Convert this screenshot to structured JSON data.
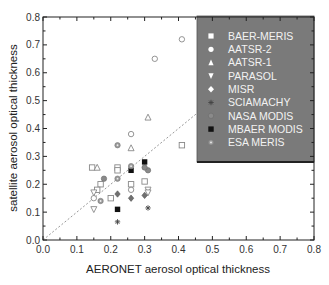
{
  "chart_data": {
    "type": "scatter",
    "title": "",
    "xlabel": "AERONET aerosol optical thickness",
    "ylabel": "satellite aerosol optical thickness",
    "xlim": [
      0.0,
      0.8
    ],
    "ylim": [
      0.0,
      0.8
    ],
    "xticks": [
      "0.0",
      "0.1",
      "0.2",
      "0.3",
      "0.4",
      "0.5",
      "0.6",
      "0.7",
      "0.8"
    ],
    "yticks": [
      "0.0",
      "0.1",
      "0.2",
      "0.3",
      "0.4",
      "0.5",
      "0.6",
      "0.7",
      "0.8"
    ],
    "grid": false,
    "legend_position": "top-right",
    "reference_line": {
      "style": "dotted",
      "label": "1:1",
      "from": [
        0.0,
        0.0
      ],
      "to": [
        0.8,
        0.8
      ]
    },
    "series": [
      {
        "name": "BAER-MERIS",
        "marker": "square-open",
        "points": [
          [
            0.145,
            0.26
          ],
          [
            0.17,
            0.2
          ],
          [
            0.16,
            0.18
          ],
          [
            0.2,
            0.15
          ],
          [
            0.22,
            0.26
          ],
          [
            0.22,
            0.25
          ],
          [
            0.26,
            0.2
          ],
          [
            0.3,
            0.21
          ],
          [
            0.41,
            0.34
          ]
        ]
      },
      {
        "name": "AATSR-2",
        "marker": "circle-open",
        "points": [
          [
            0.41,
            0.72
          ],
          [
            0.33,
            0.65
          ],
          [
            0.26,
            0.38
          ],
          [
            0.26,
            0.18
          ],
          [
            0.15,
            0.15
          ]
        ]
      },
      {
        "name": "AATSR-1",
        "marker": "triangle-open",
        "points": [
          [
            0.31,
            0.44
          ],
          [
            0.16,
            0.26
          ],
          [
            0.26,
            0.33
          ]
        ]
      },
      {
        "name": "PARASOL",
        "marker": "triangle-down-open",
        "points": [
          [
            0.15,
            0.17
          ],
          [
            0.15,
            0.11
          ],
          [
            0.31,
            0.18
          ],
          [
            0.31,
            0.17
          ]
        ]
      },
      {
        "name": "MISR",
        "marker": "diamond-grey",
        "points": [
          [
            0.22,
            0.165
          ],
          [
            0.26,
            0.15
          ],
          [
            0.3,
            0.16
          ]
        ]
      },
      {
        "name": "SCIAMACHY",
        "marker": "asterisk",
        "points": [
          [
            0.22,
            0.065
          ],
          [
            0.31,
            0.115
          ]
        ]
      },
      {
        "name": "NASA MODIS",
        "marker": "circle-grey",
        "points": [
          [
            0.18,
            0.22
          ],
          [
            0.31,
            0.25
          ],
          [
            0.3,
            0.26
          ]
        ]
      },
      {
        "name": "MBAER MODIS",
        "marker": "square-black",
        "points": [
          [
            0.22,
            0.11
          ],
          [
            0.26,
            0.25
          ],
          [
            0.3,
            0.28
          ]
        ]
      },
      {
        "name": "ESA MERIS",
        "marker": "circle-dotted",
        "points": [
          [
            0.22,
            0.34
          ],
          [
            0.22,
            0.22
          ],
          [
            0.17,
            0.14
          ],
          [
            0.26,
            0.265
          ]
        ]
      }
    ]
  },
  "colors": {
    "legend_bg": "#7a7a7a",
    "legend_text": "#f2f2f2",
    "axis": "#222222",
    "open_marker": "#888888",
    "grey_marker": "#707070",
    "black_marker": "#111111",
    "ref_line": "#999999"
  }
}
